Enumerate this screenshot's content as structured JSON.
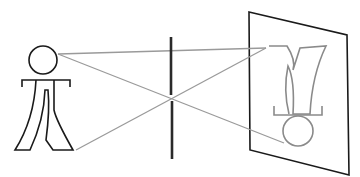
{
  "diagram": {
    "type": "pinhole-camera",
    "colors": {
      "outline": "#1a1a1a",
      "ray": "#9a9a9a",
      "image": "#8a8a8a",
      "background": "#ffffff"
    },
    "elements": [
      {
        "name": "object-figure",
        "description": "upright stick figure"
      },
      {
        "name": "barrier",
        "description": "vertical barrier with pinhole"
      },
      {
        "name": "light-rays",
        "count": 2
      },
      {
        "name": "screen",
        "description": "projection screen (parallelogram)"
      },
      {
        "name": "inverted-image",
        "description": "upside-down figure projected on screen"
      }
    ]
  }
}
